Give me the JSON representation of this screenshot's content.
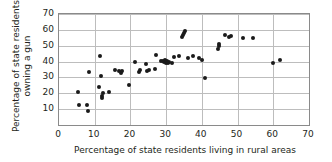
{
  "chart_data": {
    "type": "scatter",
    "title": "",
    "xlabel": "Percentage of state residents living in rural areas",
    "ylabel_line1": "Percentage of state residents",
    "ylabel_line2": "owning a gun",
    "xlim": [
      0,
      70
    ],
    "ylim": [
      0,
      70
    ],
    "xticks": [
      0,
      10,
      20,
      30,
      40,
      50,
      60,
      70
    ],
    "yticks": [
      10,
      20,
      30,
      40,
      50,
      60,
      70
    ],
    "grid": true,
    "legend": "none",
    "marker_color": "#1a1a1a",
    "points": [
      {
        "x": 5.4,
        "y": 21.0
      },
      {
        "x": 5.6,
        "y": 12.3
      },
      {
        "x": 7.9,
        "y": 12.7
      },
      {
        "x": 8.2,
        "y": 8.8
      },
      {
        "x": 8.4,
        "y": 33.6
      },
      {
        "x": 11.2,
        "y": 24.2
      },
      {
        "x": 11.4,
        "y": 43.4
      },
      {
        "x": 11.8,
        "y": 30.6
      },
      {
        "x": 12.0,
        "y": 18.5
      },
      {
        "x": 12.1,
        "y": 17.2
      },
      {
        "x": 12.2,
        "y": 20.0
      },
      {
        "x": 14.1,
        "y": 20.7
      },
      {
        "x": 15.6,
        "y": 34.7
      },
      {
        "x": 16.9,
        "y": 34.3
      },
      {
        "x": 17.3,
        "y": 32.6
      },
      {
        "x": 17.5,
        "y": 33.8
      },
      {
        "x": 19.7,
        "y": 25.1
      },
      {
        "x": 21.2,
        "y": 39.9
      },
      {
        "x": 22.4,
        "y": 33.2
      },
      {
        "x": 22.7,
        "y": 34.5
      },
      {
        "x": 24.3,
        "y": 38.3
      },
      {
        "x": 24.6,
        "y": 34.2
      },
      {
        "x": 25.3,
        "y": 34.8
      },
      {
        "x": 26.9,
        "y": 35.2
      },
      {
        "x": 27.2,
        "y": 43.9
      },
      {
        "x": 28.6,
        "y": 40.3
      },
      {
        "x": 29.1,
        "y": 40.1
      },
      {
        "x": 29.4,
        "y": 39.8
      },
      {
        "x": 29.6,
        "y": 41.0
      },
      {
        "x": 29.9,
        "y": 39.3
      },
      {
        "x": 30.2,
        "y": 40.4
      },
      {
        "x": 30.4,
        "y": 38.9
      },
      {
        "x": 30.8,
        "y": 40.0
      },
      {
        "x": 31.5,
        "y": 38.8
      },
      {
        "x": 32.1,
        "y": 43.0
      },
      {
        "x": 33.6,
        "y": 43.8
      },
      {
        "x": 34.3,
        "y": 55.2
      },
      {
        "x": 34.6,
        "y": 56.6
      },
      {
        "x": 35.0,
        "y": 58.2
      },
      {
        "x": 35.2,
        "y": 59.4
      },
      {
        "x": 36.2,
        "y": 42.5
      },
      {
        "x": 37.6,
        "y": 43.3
      },
      {
        "x": 39.3,
        "y": 42.0
      },
      {
        "x": 39.9,
        "y": 41.0
      },
      {
        "x": 41.0,
        "y": 29.5
      },
      {
        "x": 44.5,
        "y": 47.8
      },
      {
        "x": 44.7,
        "y": 50.0
      },
      {
        "x": 44.9,
        "y": 51.2
      },
      {
        "x": 46.5,
        "y": 57.0
      },
      {
        "x": 47.6,
        "y": 55.2
      },
      {
        "x": 48.1,
        "y": 56.1
      },
      {
        "x": 51.6,
        "y": 55.0
      },
      {
        "x": 54.2,
        "y": 55.0
      },
      {
        "x": 59.9,
        "y": 39.4
      },
      {
        "x": 61.9,
        "y": 41.0
      }
    ]
  }
}
